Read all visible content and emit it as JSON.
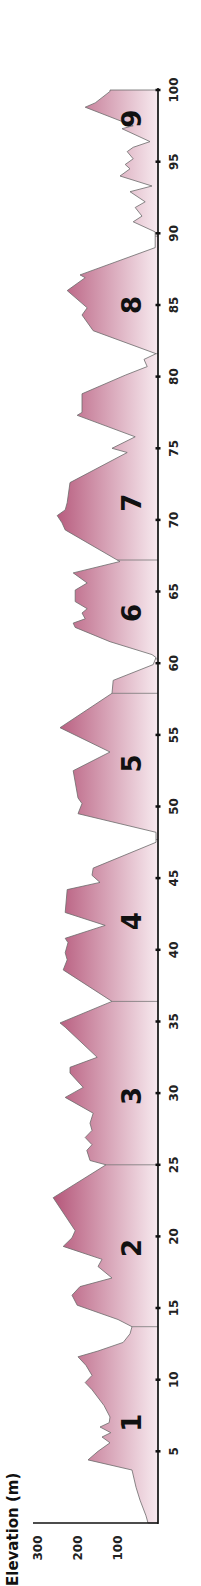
{
  "chart_data": {
    "type": "area",
    "title": "",
    "xlabel": "",
    "ylabel": "Elevation (m)",
    "orientation": "rotated -90deg (distance axis runs bottom-to-top, elevation increases to the left)",
    "xlim": [
      0,
      100
    ],
    "ylim": [
      0,
      300
    ],
    "x_ticks": [
      5,
      10,
      15,
      20,
      25,
      30,
      35,
      40,
      45,
      50,
      55,
      60,
      65,
      70,
      75,
      80,
      85,
      90,
      95,
      100
    ],
    "y_ticks": [
      100,
      200,
      300
    ],
    "grid": false,
    "legend": null,
    "fill_color_top": "#b5577a",
    "fill_color_bottom": "#f7eaef",
    "stage_boundaries_km": [
      13.7,
      25,
      36.4,
      47.7,
      57.9,
      60.3,
      67.2,
      81.6,
      89.8
    ],
    "stages": [
      {
        "label": "1",
        "km": 7.0
      },
      {
        "label": "2",
        "km": 19.2
      },
      {
        "label": "3",
        "km": 29.8
      },
      {
        "label": "4",
        "km": 42.0
      },
      {
        "label": "5",
        "km": 53.0
      },
      {
        "label": "6",
        "km": 63.5
      },
      {
        "label": "7",
        "km": 71.2
      },
      {
        "label": "8",
        "km": 85.0
      },
      {
        "label": "9",
        "km": 98.0
      }
    ],
    "profile": {
      "x_km": [
        0,
        0.5,
        1.6,
        2.5,
        3.7,
        4.4,
        5.0,
        5.6,
        6.0,
        6.3,
        6.7,
        7.0,
        7.4,
        8.2,
        9.3,
        9.8,
        10.3,
        11.0,
        11.6,
        12.0,
        12.6,
        13.2,
        13.7,
        14.2,
        15.2,
        15.9,
        16.5,
        17.1,
        17.9,
        18.4,
        19.3,
        19.9,
        20.4,
        22.7,
        25.0,
        25.3,
        26.0,
        26.4,
        26.9,
        27.4,
        27.9,
        28.6,
        29.7,
        30.4,
        31.4,
        31.8,
        32.5,
        34.6,
        34.9,
        36.4,
        38.6,
        39.3,
        39.8,
        40.5,
        40.8,
        41.7,
        42.6,
        44.2,
        44.7,
        45.2,
        45.7,
        47.5,
        48.2,
        49.5,
        50.2,
        50.6,
        52.5,
        53.8,
        55.5,
        57.9,
        58.8,
        59.9,
        60.4,
        60.6,
        61.5,
        62.5,
        62.8,
        63.1,
        63.5,
        63.8,
        64.3,
        65.1,
        65.6,
        66.3,
        67.1,
        67.2,
        69.3,
        69.8,
        70.3,
        70.7,
        71.2,
        72.6,
        74.7,
        75.0,
        75.8,
        77.3,
        77.5,
        78.8,
        80.1,
        80.7,
        81.2,
        81.6,
        83.2,
        84.3,
        84.8,
        86.0,
        86.9,
        87.1,
        89.0,
        90.1,
        90.8,
        91.2,
        91.8,
        92.2,
        92.9,
        93.3,
        94.0,
        94.5,
        94.8,
        95.2,
        95.7,
        96.0,
        96.4,
        97.3,
        97.5,
        98.8,
        99.1,
        99.9,
        100
      ],
      "elevation_m": [
        25,
        30,
        45,
        55,
        65,
        175,
        150,
        120,
        140,
        118,
        145,
        122,
        120,
        135,
        165,
        182,
        165,
        180,
        200,
        150,
        87,
        70,
        65,
        100,
        202,
        215,
        195,
        115,
        150,
        140,
        237,
        215,
        207,
        262,
        130,
        170,
        178,
        165,
        182,
        165,
        170,
        162,
        232,
        187,
        220,
        220,
        152,
        232,
        245,
        115,
        237,
        227,
        232,
        225,
        232,
        132,
        232,
        227,
        145,
        165,
        162,
        5,
        5,
        200,
        190,
        200,
        212,
        120,
        245,
        115,
        112,
        12,
        5,
        15,
        120,
        207,
        212,
        182,
        190,
        177,
        207,
        207,
        177,
        212,
        95,
        102,
        232,
        240,
        252,
        232,
        227,
        220,
        77,
        115,
        57,
        202,
        190,
        190,
        82,
        27,
        35,
        5,
        162,
        190,
        177,
        227,
        182,
        195,
        7,
        7,
        62,
        40,
        57,
        32,
        70,
        15,
        95,
        70,
        82,
        62,
        77,
        62,
        20,
        90,
        62,
        182,
        157,
        120,
        120
      ]
    }
  },
  "axis": {
    "y_title": "Elevation (m)",
    "y_tick_labels": [
      "300",
      "200",
      "100"
    ]
  }
}
